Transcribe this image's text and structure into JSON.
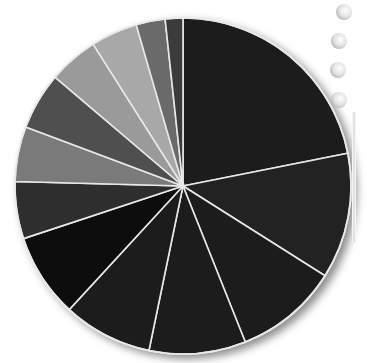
{
  "chart_data": {
    "type": "pie",
    "title": "",
    "labels_visible": false,
    "legend": "none",
    "start_angle_deg": 0,
    "direction": "clockwise",
    "center": [
      183,
      186
    ],
    "radius": 168,
    "slices": [
      {
        "index": 1,
        "value_pct": 21.9,
        "color": "#1c1c1c"
      },
      {
        "index": 2,
        "value_pct": 12.1,
        "color": "#222222"
      },
      {
        "index": 3,
        "value_pct": 10.0,
        "color": "#1e1e1e"
      },
      {
        "index": 4,
        "value_pct": 9.3,
        "color": "#1a1a1a"
      },
      {
        "index": 5,
        "value_pct": 8.6,
        "color": "#1d1d1d"
      },
      {
        "index": 6,
        "value_pct": 8.1,
        "color": "#0a0a0a"
      },
      {
        "index": 7,
        "value_pct": 5.5,
        "color": "#2e2e2e"
      },
      {
        "index": 8,
        "value_pct": 5.3,
        "color": "#7a7a7a"
      },
      {
        "index": 9,
        "value_pct": 5.5,
        "color": "#505050"
      },
      {
        "index": 10,
        "value_pct": 4.8,
        "color": "#9a9a9a"
      },
      {
        "index": 11,
        "value_pct": 4.5,
        "color": "#a8a8a8"
      },
      {
        "index": 12,
        "value_pct": 2.8,
        "color": "#6a6a6a"
      },
      {
        "index": 13,
        "value_pct": 1.7,
        "color": "#3a3a3a"
      }
    ],
    "separator_color": "#e8e8e8"
  },
  "decor": {
    "binder_rings": [
      [
        336,
        4
      ],
      [
        331,
        33
      ],
      [
        330,
        62
      ],
      [
        331,
        92
      ]
    ]
  }
}
